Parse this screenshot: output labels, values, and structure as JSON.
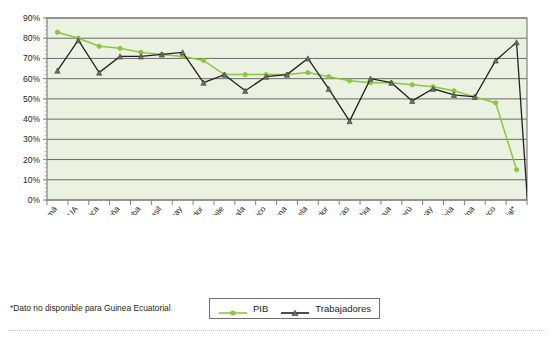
{
  "chart_data": {
    "type": "line",
    "title": "",
    "subtitle": "",
    "xlabel": "",
    "ylabel": "",
    "ylim": [
      0,
      90
    ],
    "ytick_labels": [
      "90%",
      "80%",
      "70%",
      "60%",
      "50%",
      "40%",
      "30%",
      "20%",
      "10%",
      "0%"
    ],
    "ytick_values": [
      90,
      80,
      70,
      60,
      50,
      40,
      30,
      20,
      10,
      0
    ],
    "grid": true,
    "legend_position": "bottom-center",
    "categories": [
      "Panamá",
      "EUA",
      "Costa Rica",
      "España",
      "Cuba",
      "Brasil",
      "Uruguay",
      "El Salvador",
      "Chile",
      "Guatemala",
      "México",
      "República Dominicana",
      "Venezuela",
      "Ecuador",
      "Honduras",
      "Colombia",
      "Nicaragua",
      "Perú",
      "Paraguay",
      "Bolivia",
      "Argentina",
      "Puerto Rico",
      "Guinea Ecuatorial*"
    ],
    "series": [
      {
        "name": "PIB",
        "color": "#8cc63f",
        "marker": "circle",
        "values": [
          83,
          80,
          76,
          75,
          73,
          72,
          71,
          69,
          62,
          62,
          62,
          62,
          63,
          61,
          59,
          58,
          58,
          57,
          56,
          54,
          51,
          48,
          15
        ]
      },
      {
        "name": "Trabajadores",
        "color": "#231f20",
        "marker": "triangle",
        "values": [
          64,
          79,
          63,
          71,
          71,
          72,
          73,
          58,
          62,
          54,
          61,
          62,
          70,
          55,
          39,
          60,
          58,
          49,
          55,
          52,
          51,
          69,
          78
        ]
      }
    ],
    "annotations": [
      {
        "text": "Serie Trabajadores desciende a 0% en el borde derecho",
        "series": "Trabajadores",
        "value": 0
      }
    ]
  },
  "legend": {
    "items": [
      {
        "label": "PIB",
        "color": "#8cc63f",
        "marker": "circle"
      },
      {
        "label": "Trabajadores",
        "color": "#231f20",
        "marker": "triangle"
      }
    ]
  },
  "footnote": {
    "text": "*Dato no disponible para Guinea Ecuatorial"
  },
  "colors": {
    "plot_background": "#ebf2e1",
    "gridline": "#6b6b6b",
    "axis": "#808080",
    "pib": "#8cc63f",
    "trabajadores": "#231f20",
    "text": "#231f20",
    "bottom_rule": "#b9cfa4"
  }
}
